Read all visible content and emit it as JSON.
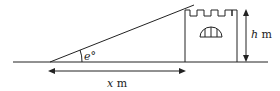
{
  "diagram": {
    "angle_label": "e°",
    "angle_symbol": "e",
    "x_label_var": "x",
    "x_label_unit": "m",
    "h_label_var": "h",
    "h_label_unit": "m",
    "stroke_color": "#222222",
    "background": "#ffffff"
  }
}
